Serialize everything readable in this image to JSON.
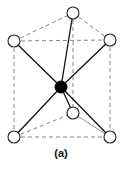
{
  "figure": {
    "label": "(a)"
  },
  "atoms": {
    "center": {
      "x": 61,
      "y": 87,
      "r": 6,
      "filled": true
    },
    "top_back": {
      "x": 73,
      "y": 13,
      "r": 6,
      "filled": false
    },
    "top_left": {
      "x": 14,
      "y": 41,
      "r": 6,
      "filled": false
    },
    "top_right": {
      "x": 110,
      "y": 40,
      "r": 6,
      "filled": false
    },
    "bottom_front": {
      "x": 73,
      "y": 113,
      "r": 6,
      "filled": false
    },
    "bottom_left": {
      "x": 14,
      "y": 137,
      "r": 6,
      "filled": false
    },
    "bottom_right": {
      "x": 110,
      "y": 137,
      "r": 6,
      "filled": false
    }
  },
  "colors": {
    "bond": "#111111",
    "edge": "#777777",
    "atom_fill_open": "#ffffff",
    "atom_fill_center": "#000000",
    "background": "#ffffff"
  }
}
